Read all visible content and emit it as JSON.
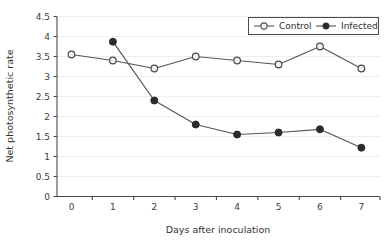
{
  "chart_data": {
    "type": "line",
    "title": "",
    "xlabel": "Days after inoculation",
    "ylabel": "Net photosynthetic rate",
    "x": [
      0,
      1,
      2,
      3,
      4,
      5,
      6,
      7
    ],
    "xlim": [
      -0.35,
      7.45
    ],
    "ylim": [
      0,
      4.5
    ],
    "xticks": [
      "0",
      "1",
      "2",
      "3",
      "4",
      "5",
      "6",
      "7"
    ],
    "yticks": [
      "0",
      "0.5",
      "1",
      "1.5",
      "2",
      "2.5",
      "3",
      "3.5",
      "4",
      "4.5"
    ],
    "grid": "horizontal",
    "legend_position": "top-right-inside",
    "series": [
      {
        "name": "Control",
        "marker": "open-circle",
        "color": "#555555",
        "marker_fill": "#f2f2f2",
        "x": [
          0,
          1,
          2,
          3,
          4,
          5,
          6,
          7
        ],
        "values": [
          3.55,
          3.4,
          3.2,
          3.5,
          3.4,
          3.3,
          3.75,
          3.2
        ]
      },
      {
        "name": "Infected",
        "marker": "filled-circle",
        "color": "#555555",
        "marker_fill": "#2b2b2b",
        "x": [
          1,
          2,
          3,
          4,
          5,
          6,
          7
        ],
        "values": [
          3.87,
          2.4,
          1.8,
          1.55,
          1.6,
          1.68,
          1.22
        ]
      }
    ]
  },
  "legend": {
    "items": [
      {
        "label": "Control"
      },
      {
        "label": "Infected"
      }
    ]
  },
  "colors": {
    "background": "#ffffff",
    "axis": "#4a4a4a",
    "gridline": "#eceff1",
    "line": "#555555",
    "open_marker_fill": "#f2f2f2",
    "filled_marker": "#2b2b2b",
    "text": "#333333"
  }
}
